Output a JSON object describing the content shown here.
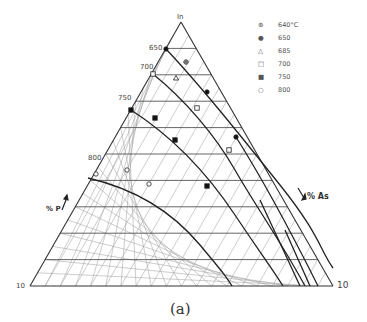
{
  "figure": {
    "caption": "(a)",
    "apex_label": "In",
    "left_corner_label": "10",
    "right_corner_label": "10",
    "left_axis_label": "% P",
    "right_axis_label": "% As",
    "isotherm_labels": [
      {
        "text": "650",
        "x": 149,
        "y": 45
      },
      {
        "text": "700",
        "x": 140,
        "y": 67
      },
      {
        "text": "750",
        "x": 118,
        "y": 98
      },
      {
        "text": "800",
        "x": 88,
        "y": 158
      }
    ]
  },
  "legend": [
    {
      "symbol": "circle-plus",
      "label": "640°C"
    },
    {
      "symbol": "filled-circle",
      "label": "650"
    },
    {
      "symbol": "open-triangle",
      "label": "685"
    },
    {
      "symbol": "open-square",
      "label": "700"
    },
    {
      "symbol": "filled-square",
      "label": "750"
    },
    {
      "symbol": "open-circle",
      "label": "800"
    }
  ],
  "diagram": {
    "type": "ternary",
    "vertices": {
      "top": [
        181,
        22
      ],
      "bottom_left": [
        30,
        286
      ],
      "bottom_right": [
        333,
        286
      ]
    },
    "divisions": 10,
    "minor_divisions": 20,
    "points": [
      {
        "symbol": "circle-plus",
        "x": 186,
        "y": 62
      },
      {
        "symbol": "filled-circle",
        "x": 166,
        "y": 49
      },
      {
        "symbol": "filled-circle",
        "x": 207,
        "y": 92
      },
      {
        "symbol": "filled-circle",
        "x": 236,
        "y": 137
      },
      {
        "symbol": "open-triangle",
        "x": 176,
        "y": 78
      },
      {
        "symbol": "open-square",
        "x": 153,
        "y": 74
      },
      {
        "symbol": "open-square",
        "x": 197,
        "y": 108
      },
      {
        "symbol": "open-square",
        "x": 229,
        "y": 150
      },
      {
        "symbol": "filled-square",
        "x": 131,
        "y": 110
      },
      {
        "symbol": "filled-square",
        "x": 155,
        "y": 118
      },
      {
        "symbol": "filled-square",
        "x": 175,
        "y": 140
      },
      {
        "symbol": "filled-square",
        "x": 207,
        "y": 186
      },
      {
        "symbol": "open-circle",
        "x": 96,
        "y": 174
      },
      {
        "symbol": "open-circle",
        "x": 127,
        "y": 170
      },
      {
        "symbol": "open-circle",
        "x": 149,
        "y": 184
      }
    ]
  }
}
